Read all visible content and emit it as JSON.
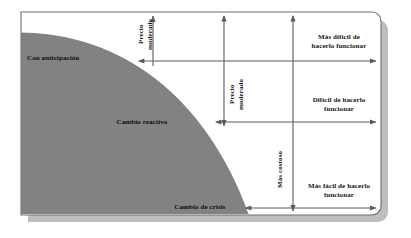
{
  "diagram": {
    "colors": {
      "fill_gray": "#828282",
      "frame_border": "#6e6e6e",
      "shadow": "#bdbdbd",
      "arrow": "#5a5a5a",
      "text": "#141414",
      "background": "#ffffff"
    },
    "region_labels": [
      {
        "id": "con-anticipacion",
        "text": "Con anticipación"
      },
      {
        "id": "cambio-reactivo",
        "text": "Cambio reactivo"
      },
      {
        "id": "cambio-de-crisis",
        "text": "Cambio de crisis"
      }
    ],
    "vertical_labels": [
      {
        "id": "precio-moderado-1",
        "text": "Precio\nmoderado"
      },
      {
        "id": "precio-moderado-2",
        "text": "Precio\nmoderado"
      },
      {
        "id": "mas-costoso",
        "text": "Más costoso"
      }
    ],
    "horizontal_labels": [
      {
        "id": "mas-dificil",
        "text": "Más difícil de\nhacerlo funcionar"
      },
      {
        "id": "dificil",
        "text": "Difícil de hacerlo\nfuncionar"
      },
      {
        "id": "mas-facil",
        "text": "Más fácil de hacerlo\nfuncionar"
      }
    ]
  }
}
